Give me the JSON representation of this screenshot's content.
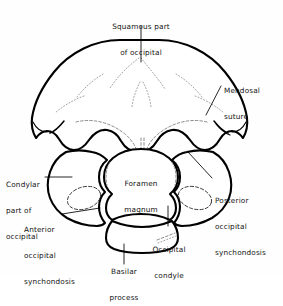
{
  "figure": {
    "background_color": "#fefefe",
    "line_color": "#000000",
    "width": 283,
    "height": 275
  },
  "labels": {
    "squamous": {
      "line1": "Squamous part",
      "line2": "of occipital"
    },
    "mendosal": {
      "line1": "Mendosal",
      "line2": "suture"
    },
    "posterior_synchondosis": {
      "line1": "Posterior",
      "line2": "occipital",
      "line3": "synchondosis"
    },
    "condylar": {
      "line1": "Condylar",
      "line2": "part of",
      "line3": "occipital"
    },
    "anterior_synchondosis": {
      "line1": "Anterior",
      "line2": "occipital",
      "line3": "synchondosis"
    },
    "foramen_magnum": {
      "line1": "Foramen",
      "line2": "magnum"
    },
    "basilar": {
      "line1": "Basilar",
      "line2": "process"
    },
    "occipital_condyle": {
      "line1": "Occipital",
      "line2": "condyle"
    }
  },
  "parts": {
    "squamous_part": "squamous-part-of-occipital",
    "left_condylar_part": "left-condylar-part-of-occipital",
    "right_condylar_part": "right-condylar-part-of-occipital",
    "foramen_magnum": "foramen-magnum-opening",
    "basilar_process": "basilar-process",
    "left_condyle": "left-occipital-condyle",
    "right_condyle": "right-occipital-condyle"
  }
}
